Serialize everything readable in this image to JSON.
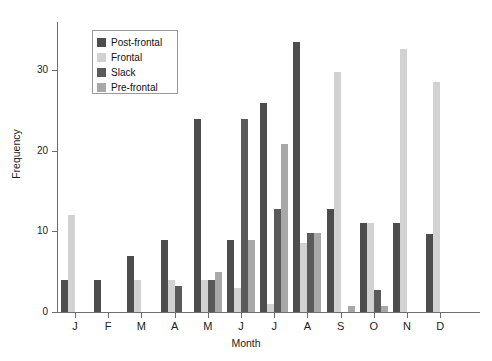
{
  "chart_data": {
    "type": "bar",
    "title": "",
    "xlabel": "Month",
    "ylabel": "Frequency",
    "categories": [
      "J",
      "F",
      "M",
      "A",
      "M",
      "J",
      "J",
      "A",
      "S",
      "O",
      "N",
      "D"
    ],
    "category_names": [
      "January",
      "February",
      "March",
      "April",
      "May",
      "June",
      "July",
      "August",
      "September",
      "October",
      "November",
      "December"
    ],
    "ylim": [
      0,
      36
    ],
    "yticks": [
      0,
      10,
      20,
      30
    ],
    "ytick_labels": [
      "0",
      "10",
      "20",
      "30"
    ],
    "grid": false,
    "legend_position": "upper-left-inside",
    "series": [
      {
        "name": "Post-frontal",
        "color": "#4d4d4d",
        "values": [
          4.0,
          4.0,
          7.0,
          9.0,
          24.0,
          9.0,
          26.0,
          33.5,
          12.8,
          11.0,
          11.0,
          9.7
        ]
      },
      {
        "name": "Frontal",
        "color": "#d2d2d2",
        "values": [
          12.0,
          0.0,
          4.0,
          4.0,
          4.0,
          3.0,
          1.0,
          8.6,
          29.8,
          11.0,
          32.6,
          28.6
        ]
      },
      {
        "name": "Slack",
        "color": "#5a5a5a",
        "values": [
          0.0,
          0.0,
          0.0,
          3.2,
          4.0,
          24.0,
          12.8,
          9.8,
          0.0,
          2.7,
          0.0,
          0.0
        ]
      },
      {
        "name": "Pre-frontal",
        "color": "#a8a8a8",
        "values": [
          0.0,
          0.0,
          0.0,
          0.0,
          5.0,
          9.0,
          20.9,
          9.8,
          0.8,
          0.8,
          0.0,
          0.0
        ]
      }
    ]
  },
  "legend": {
    "items": [
      {
        "label": "Post-frontal",
        "color": "#4d4d4d"
      },
      {
        "label": "Frontal",
        "color": "#d2d2d2"
      },
      {
        "label": "Slack",
        "color": "#5a5a5a"
      },
      {
        "label": "Pre-frontal",
        "color": "#a8a8a8"
      }
    ]
  },
  "axes": {
    "y_title": "Frequency",
    "x_title": "Month"
  }
}
